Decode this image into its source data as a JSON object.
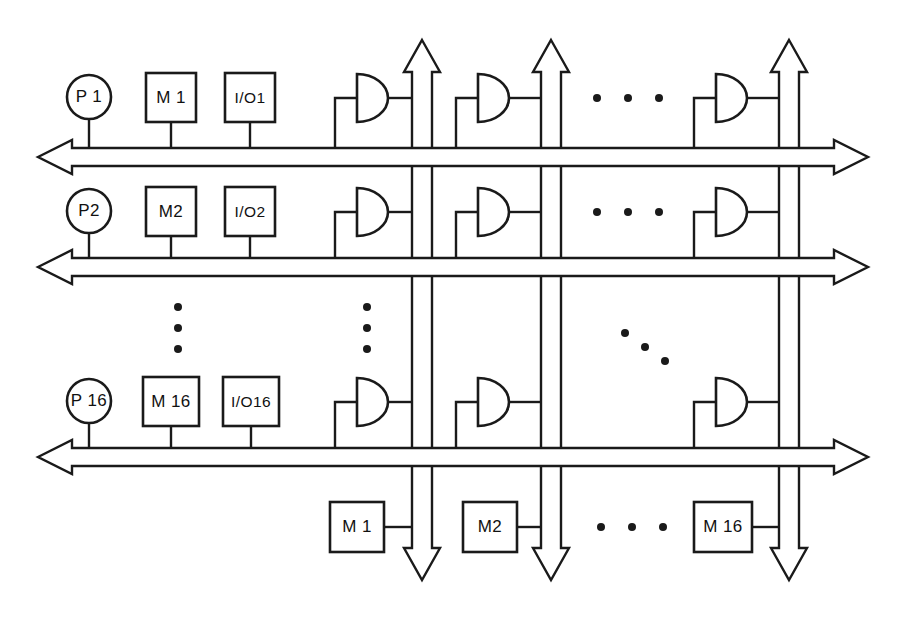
{
  "diagram": {
    "canvas": {
      "width": 903,
      "height": 618
    },
    "colors": {
      "ink": "#1a1a1a",
      "background": "#ffffff"
    }
  },
  "processor_rows": [
    {
      "id": "row-1",
      "bus_y": 157,
      "processor": {
        "label": "P 1",
        "cx": 89,
        "cy": 97,
        "r": 22
      },
      "memory": {
        "label": "M 1",
        "x": 146,
        "y": 73,
        "w": 50,
        "h": 49
      },
      "io": {
        "label": "I/O1",
        "x": 225,
        "y": 73,
        "w": 50,
        "h": 49
      },
      "gates": [
        {
          "id": "gate-r1-c1",
          "x": 357,
          "y": 98
        },
        {
          "id": "gate-r1-c2",
          "x": 478,
          "y": 98
        },
        {
          "id": "gate-r1-c3",
          "x": 716,
          "y": 98
        }
      ]
    },
    {
      "id": "row-2",
      "bus_y": 267,
      "processor": {
        "label": "P2",
        "cx": 89,
        "cy": 211,
        "r": 22
      },
      "memory": {
        "label": "M2",
        "x": 146,
        "y": 187,
        "w": 50,
        "h": 49
      },
      "io": {
        "label": "I/O2",
        "x": 225,
        "y": 187,
        "w": 50,
        "h": 49
      },
      "gates": [
        {
          "id": "gate-r2-c1",
          "x": 357,
          "y": 212
        },
        {
          "id": "gate-r2-c2",
          "x": 478,
          "y": 212
        },
        {
          "id": "gate-r2-c3",
          "x": 716,
          "y": 212
        }
      ]
    },
    {
      "id": "row-16",
      "bus_y": 457,
      "processor": {
        "label": "P 16",
        "cx": 89,
        "cy": 401,
        "r": 22
      },
      "memory": {
        "label": "M 16",
        "x": 143,
        "y": 377,
        "w": 56,
        "h": 49
      },
      "io": {
        "label": "I/O16",
        "x": 223,
        "y": 377,
        "w": 56,
        "h": 49
      },
      "gates": [
        {
          "id": "gate-r16-c1",
          "x": 357,
          "y": 402
        },
        {
          "id": "gate-r16-c2",
          "x": 478,
          "y": 402
        },
        {
          "id": "gate-r16-c3",
          "x": 716,
          "y": 402
        }
      ]
    }
  ],
  "vertical_buses": [
    {
      "id": "vbus-1",
      "x": 422
    },
    {
      "id": "vbus-2",
      "x": 551
    },
    {
      "id": "vbus-3",
      "x": 789
    }
  ],
  "shared_memories": [
    {
      "id": "shared-m-1",
      "label": "M 1",
      "x": 330,
      "y": 502,
      "w": 54,
      "h": 50
    },
    {
      "id": "shared-m-2",
      "label": "M2",
      "x": 463,
      "y": 502,
      "w": 54,
      "h": 50
    },
    {
      "id": "shared-m-16",
      "label": "M 16",
      "x": 694,
      "y": 502,
      "w": 58,
      "h": 50
    }
  ],
  "ellipses": [
    {
      "id": "ellipsis-row-1",
      "orientation": "horizontal",
      "dots": [
        [
          597,
          98
        ],
        [
          628,
          98
        ],
        [
          659,
          98
        ]
      ]
    },
    {
      "id": "ellipsis-row-2",
      "orientation": "horizontal",
      "dots": [
        [
          597,
          212
        ],
        [
          628,
          212
        ],
        [
          659,
          212
        ]
      ]
    },
    {
      "id": "ellipsis-col-processors",
      "orientation": "vertical",
      "dots": [
        [
          178,
          307
        ],
        [
          178,
          328
        ],
        [
          178,
          349
        ]
      ]
    },
    {
      "id": "ellipsis-col-io",
      "orientation": "vertical",
      "dots": [
        [
          367,
          307
        ],
        [
          367,
          328
        ],
        [
          367,
          349
        ]
      ]
    },
    {
      "id": "ellipsis-diagonal-gates",
      "orientation": "diagonal",
      "dots": [
        [
          625,
          333
        ],
        [
          645,
          347
        ],
        [
          665,
          361
        ]
      ]
    },
    {
      "id": "ellipsis-shared-memory",
      "orientation": "horizontal",
      "dots": [
        [
          601,
          527
        ],
        [
          632,
          527
        ],
        [
          663,
          527
        ]
      ]
    }
  ],
  "bus_geometry": {
    "horizontal": {
      "x_left": 38,
      "x_right": 868,
      "thickness": 18,
      "head_length": 34,
      "head_half_width": 17
    },
    "vertical": {
      "y_top": 40,
      "y_bottom": 580,
      "thickness": 20,
      "head_length": 32,
      "head_half_width": 18
    }
  }
}
